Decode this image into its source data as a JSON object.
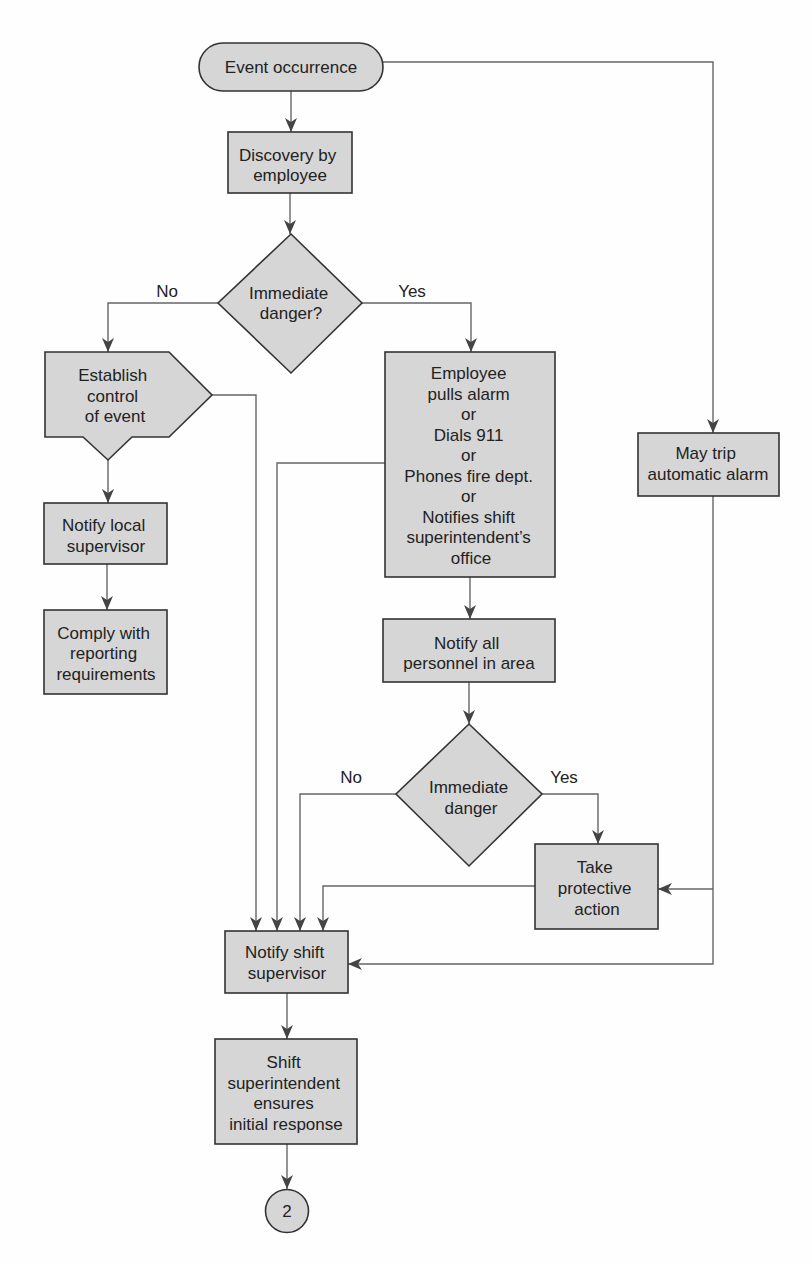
{
  "diagram": {
    "nodes": {
      "event_occurrence": {
        "shape": "terminal",
        "lines": [
          "Event occurrence"
        ]
      },
      "discovery": {
        "shape": "process",
        "lines": [
          "Discovery by",
          "employee"
        ]
      },
      "decision_1": {
        "shape": "decision",
        "lines": [
          "Immediate",
          "danger?"
        ]
      },
      "establish_control": {
        "shape": "offpage-process",
        "lines": [
          "Establish",
          "control",
          "of event"
        ]
      },
      "notify_local": {
        "shape": "process",
        "lines": [
          "Notify local",
          "supervisor"
        ]
      },
      "comply": {
        "shape": "process",
        "lines": [
          "Comply with",
          "reporting",
          "requirements"
        ]
      },
      "employee_action": {
        "shape": "process",
        "lines": [
          "Employee",
          "pulls alarm",
          "or",
          "Dials 911",
          "or",
          "Phones fire dept.",
          "or",
          "Notifies shift",
          "superintendent’s",
          "office"
        ]
      },
      "auto_alarm": {
        "shape": "process",
        "lines": [
          "May trip",
          "automatic alarm"
        ]
      },
      "notify_all": {
        "shape": "process",
        "lines": [
          "Notify all",
          "personnel in area"
        ]
      },
      "decision_2": {
        "shape": "decision",
        "lines": [
          "Immediate",
          "danger"
        ]
      },
      "protective_action": {
        "shape": "process",
        "lines": [
          "Take",
          "protective",
          "action"
        ]
      },
      "notify_shift": {
        "shape": "process",
        "lines": [
          "Notify shift",
          "supervisor"
        ]
      },
      "shift_superintendent": {
        "shape": "process",
        "lines": [
          "Shift",
          "superintendent",
          "ensures",
          "initial response"
        ]
      },
      "connector": {
        "shape": "connector",
        "label": "2"
      }
    },
    "edge_labels": {
      "d1_no": "No",
      "d1_yes": "Yes",
      "d2_no": "No",
      "d2_yes": "Yes"
    },
    "edges": [
      {
        "from": "event_occurrence",
        "to": "discovery"
      },
      {
        "from": "event_occurrence",
        "to": "auto_alarm"
      },
      {
        "from": "discovery",
        "to": "decision_1"
      },
      {
        "from": "decision_1",
        "to": "establish_control",
        "label": "No"
      },
      {
        "from": "decision_1",
        "to": "employee_action",
        "label": "Yes"
      },
      {
        "from": "establish_control",
        "to": "notify_local"
      },
      {
        "from": "establish_control",
        "to": "notify_shift"
      },
      {
        "from": "notify_local",
        "to": "comply"
      },
      {
        "from": "employee_action",
        "to": "notify_all"
      },
      {
        "from": "employee_action",
        "to": "notify_shift"
      },
      {
        "from": "notify_all",
        "to": "decision_2"
      },
      {
        "from": "decision_2",
        "to": "notify_shift",
        "label": "No"
      },
      {
        "from": "decision_2",
        "to": "protective_action",
        "label": "Yes"
      },
      {
        "from": "protective_action",
        "to": "notify_shift"
      },
      {
        "from": "auto_alarm",
        "to": "protective_action"
      },
      {
        "from": "auto_alarm",
        "to": "notify_shift"
      },
      {
        "from": "notify_shift",
        "to": "shift_superintendent"
      },
      {
        "from": "shift_superintendent",
        "to": "connector"
      }
    ],
    "colors": {
      "node_fill": "#d6d6d6",
      "node_stroke": "#333333",
      "connector_line": "#666666",
      "arrowhead": "#444444",
      "text": "#222222"
    }
  }
}
